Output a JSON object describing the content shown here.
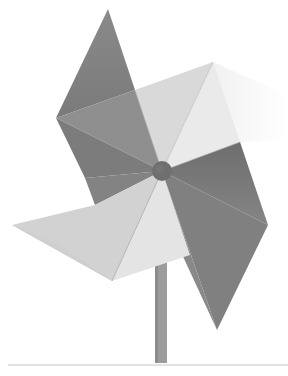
{
  "image": {
    "subject": "Paper pinwheel on a stick",
    "style": "grayscale photograph",
    "background": "#ffffff",
    "colors": {
      "dark_blade": "#7e7e7e",
      "dark_blade_shade": "#6e6e6e",
      "mid_blade": "#9a9a9a",
      "light_blade": "#d6d6d6",
      "lighter_blade": "#e6e6e6",
      "hub": "#6f6f6f",
      "stick": "#9c9c9c",
      "ground_line": "#d8d8d8"
    }
  }
}
